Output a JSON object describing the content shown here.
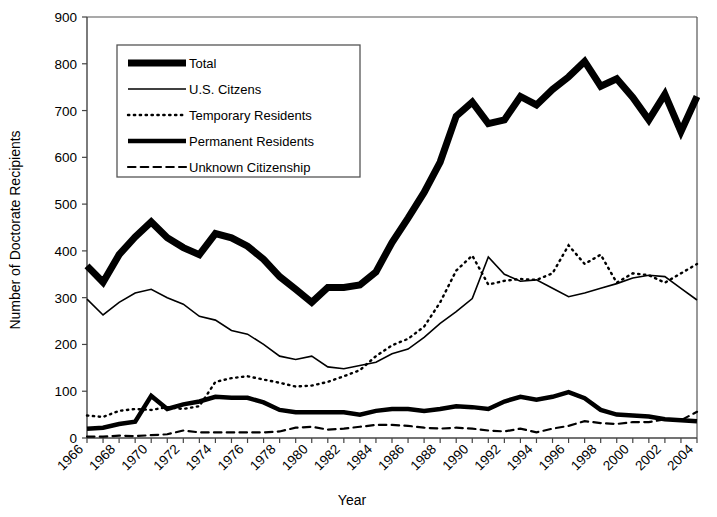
{
  "chart_data": {
    "type": "line",
    "title": "",
    "xlabel": "Year",
    "ylabel": "Number of Doctorate Recipients",
    "xlim": [
      1966,
      2004
    ],
    "ylim": [
      0,
      900
    ],
    "ytick_step": 100,
    "yticks": [
      0,
      100,
      200,
      300,
      400,
      500,
      600,
      700,
      800,
      900
    ],
    "xtick_labels": [
      "1966",
      "1968",
      "1970",
      "1972",
      "1974",
      "1976",
      "1978",
      "1980",
      "1982",
      "1984",
      "1986",
      "1988",
      "1990",
      "1992",
      "1994",
      "1996",
      "1998",
      "2000",
      "2002",
      "2004"
    ],
    "xtick_label_rotation": 45,
    "x": [
      1966,
      1967,
      1968,
      1969,
      1970,
      1971,
      1972,
      1973,
      1974,
      1975,
      1976,
      1977,
      1978,
      1979,
      1980,
      1981,
      1982,
      1983,
      1984,
      1985,
      1986,
      1987,
      1988,
      1989,
      1990,
      1991,
      1992,
      1993,
      1994,
      1995,
      1996,
      1997,
      1998,
      1999,
      2000,
      2001,
      2002,
      2003,
      2004
    ],
    "grid": false,
    "legend_position": "upper-left",
    "series": [
      {
        "name": "Total",
        "style": "solid",
        "line_width": 7,
        "color": "#000000",
        "values": [
          368,
          333,
          392,
          430,
          462,
          428,
          407,
          392,
          437,
          428,
          410,
          382,
          345,
          318,
          290,
          322,
          322,
          327,
          355,
          418,
          470,
          525,
          590,
          688,
          718,
          672,
          680,
          730,
          712,
          745,
          772,
          805,
          752,
          768,
          728,
          680,
          735,
          655,
          730
        ]
      },
      {
        "name": "U.S. Citzens",
        "style": "solid",
        "line_width": 1.6,
        "color": "#000000",
        "values": [
          297,
          263,
          290,
          310,
          318,
          300,
          286,
          260,
          252,
          230,
          222,
          200,
          175,
          168,
          175,
          152,
          148,
          155,
          162,
          180,
          190,
          215,
          245,
          270,
          298,
          387,
          350,
          335,
          338,
          320,
          302,
          310,
          320,
          330,
          342,
          348,
          345,
          320,
          295
        ]
      },
      {
        "name": "Temporary Residents",
        "style": "dotted",
        "line_width": 2.4,
        "color": "#000000",
        "values": [
          48,
          45,
          58,
          62,
          60,
          66,
          62,
          68,
          120,
          128,
          132,
          125,
          118,
          110,
          112,
          120,
          132,
          145,
          175,
          198,
          212,
          238,
          290,
          358,
          390,
          328,
          336,
          340,
          338,
          352,
          412,
          372,
          392,
          332,
          352,
          348,
          332,
          352,
          372
        ]
      },
      {
        "name": "Permanent Residents",
        "style": "solid",
        "line_width": 4.5,
        "color": "#000000",
        "values": [
          20,
          22,
          30,
          35,
          90,
          62,
          72,
          78,
          88,
          86,
          86,
          76,
          60,
          55,
          55,
          55,
          55,
          50,
          58,
          62,
          62,
          58,
          62,
          68,
          66,
          62,
          78,
          88,
          82,
          88,
          98,
          85,
          60,
          50,
          48,
          46,
          40,
          38,
          36
        ]
      },
      {
        "name": "Unknown Citizenship",
        "style": "dashed",
        "line_width": 2.2,
        "color": "#000000",
        "values": [
          3,
          3,
          5,
          4,
          6,
          8,
          16,
          12,
          12,
          12,
          12,
          12,
          14,
          22,
          24,
          18,
          20,
          24,
          28,
          28,
          26,
          22,
          20,
          22,
          20,
          16,
          14,
          20,
          12,
          20,
          26,
          36,
          32,
          30,
          34,
          34,
          40,
          38,
          56
        ]
      }
    ]
  },
  "legend": {
    "items": [
      {
        "label": "Total",
        "key": "total"
      },
      {
        "label": "U.S. Citzens",
        "key": "us-citizens"
      },
      {
        "label": "Temporary Residents",
        "key": "temporary-residents"
      },
      {
        "label": "Permanent Residents",
        "key": "permanent-residents"
      },
      {
        "label": "Unknown Citizenship",
        "key": "unknown-citizenship"
      }
    ]
  }
}
